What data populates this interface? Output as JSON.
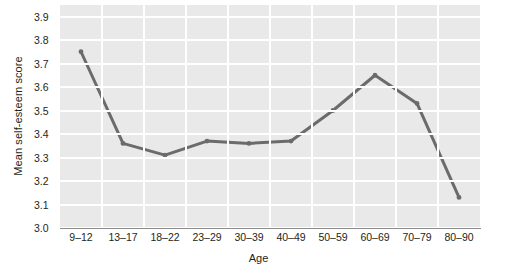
{
  "chart_data": {
    "type": "line",
    "title": "",
    "xlabel": "Age",
    "ylabel": "Mean self-esteem score",
    "categories": [
      "9–12",
      "13–17",
      "18–22",
      "23–29",
      "30–39",
      "40–49",
      "50–59",
      "60–69",
      "70–79",
      "80–90"
    ],
    "values": [
      3.75,
      3.36,
      3.31,
      3.37,
      3.36,
      3.37,
      3.5,
      3.65,
      3.53,
      3.13
    ],
    "ylim": [
      3.0,
      3.9
    ],
    "yticks": [
      "3.0",
      "3.1",
      "3.2",
      "3.3",
      "3.4",
      "3.5",
      "3.6",
      "3.7",
      "3.8",
      "3.9"
    ],
    "grid": true,
    "legend_position": "none",
    "series": [
      {
        "name": "Mean self-esteem score",
        "values": [
          3.75,
          3.36,
          3.31,
          3.37,
          3.36,
          3.37,
          3.5,
          3.65,
          3.53,
          3.13
        ]
      }
    ],
    "colors": {
      "line": "#6b6b6b",
      "plot_background": "#e9e9e9",
      "gridline": "#ffffff",
      "axis": "#8d8d8d",
      "text": "#231f20"
    }
  }
}
